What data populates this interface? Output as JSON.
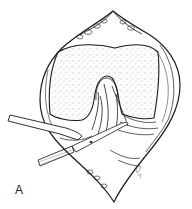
{
  "figure": {
    "panel_label": "A",
    "colors": {
      "line": "#1a1a1a",
      "background": "#ffffff",
      "stipple": "#555555"
    }
  }
}
